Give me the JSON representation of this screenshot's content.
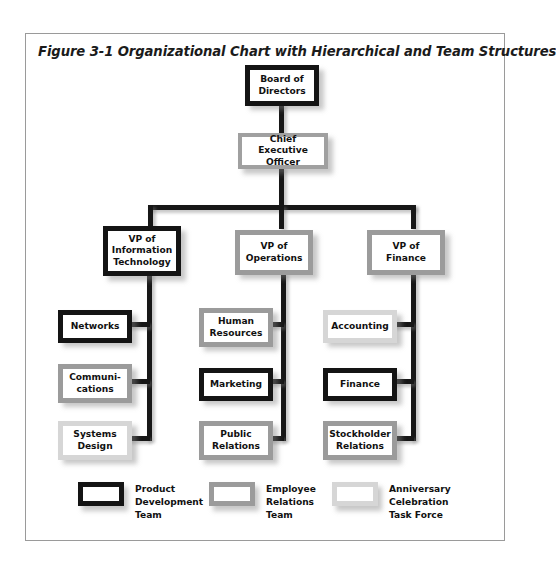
{
  "figure": {
    "caption": "Figure 3-1  Organizational Chart with Hierarchical and Team Structures"
  },
  "chart_data": {
    "type": "diagram",
    "title": "Figure 3-1  Organizational Chart with Hierarchical and Team Structures",
    "subtype": "organizational-chart",
    "team_colors": {
      "product_development_team": "#141414",
      "employee_relations_team": "#9b9b9b",
      "anniversary_celebration_task_force": "#d6d6d6"
    },
    "levels": [
      {
        "level": 1,
        "nodes": [
          "Board of Directors"
        ]
      },
      {
        "level": 2,
        "nodes": [
          "Chief Executive Officer"
        ]
      },
      {
        "level": 3,
        "nodes": [
          "VP of Information Technology",
          "VP of Operations",
          "VP of Finance"
        ]
      },
      {
        "level": 4,
        "nodes": [
          "Networks",
          "Communi-cations",
          "Systems Design",
          "Human Resources",
          "Marketing",
          "Public Relations",
          "Accounting",
          "Finance",
          "Stockholder Relations"
        ]
      }
    ],
    "edges": [
      [
        "Board of Directors",
        "Chief Executive Officer"
      ],
      [
        "Chief Executive Officer",
        "VP of Information Technology"
      ],
      [
        "Chief Executive Officer",
        "VP of Operations"
      ],
      [
        "Chief Executive Officer",
        "VP of Finance"
      ],
      [
        "VP of Information Technology",
        "Networks"
      ],
      [
        "VP of Information Technology",
        "Communi-cations"
      ],
      [
        "VP of Information Technology",
        "Systems Design"
      ],
      [
        "VP of Operations",
        "Human Resources"
      ],
      [
        "VP of Operations",
        "Marketing"
      ],
      [
        "VP of Operations",
        "Public Relations"
      ],
      [
        "VP of Finance",
        "Accounting"
      ],
      [
        "VP of Finance",
        "Finance"
      ],
      [
        "VP of Finance",
        "Stockholder Relations"
      ]
    ]
  },
  "nodes": {
    "board": {
      "label": "Board of\nDirectors",
      "team": "product_development_team"
    },
    "ceo": {
      "label": "Chief\nExecutive Officer",
      "team": "employee_relations_team"
    },
    "vp_it": {
      "label": "VP of\nInformation\nTechnology",
      "team": "product_development_team"
    },
    "vp_ops": {
      "label": "VP of\nOperations",
      "team": "employee_relations_team"
    },
    "vp_fin": {
      "label": "VP of\nFinance",
      "team": "employee_relations_team"
    },
    "networks": {
      "label": "Networks",
      "team": "product_development_team"
    },
    "communications": {
      "label": "Communi-\ncations",
      "team": "employee_relations_team"
    },
    "systems_design": {
      "label": "Systems\nDesign",
      "team": "anniversary_celebration_task_force"
    },
    "human_resources": {
      "label": "Human\nResources",
      "team": "employee_relations_team"
    },
    "marketing": {
      "label": "Marketing",
      "team": "product_development_team"
    },
    "public_relations": {
      "label": "Public\nRelations",
      "team": "employee_relations_team"
    },
    "accounting": {
      "label": "Accounting",
      "team": "anniversary_celebration_task_force"
    },
    "finance": {
      "label": "Finance",
      "team": "product_development_team"
    },
    "stockholder_relations": {
      "label": "Stockholder\nRelations",
      "team": "employee_relations_team"
    }
  },
  "legend": {
    "items": [
      {
        "label": "Product\nDevelopment\nTeam",
        "color": "#141414"
      },
      {
        "label": "Employee\nRelations\nTeam",
        "color": "#9b9b9b"
      },
      {
        "label": "Anniversary\nCelebration\nTask Force",
        "color": "#d6d6d6"
      }
    ]
  }
}
